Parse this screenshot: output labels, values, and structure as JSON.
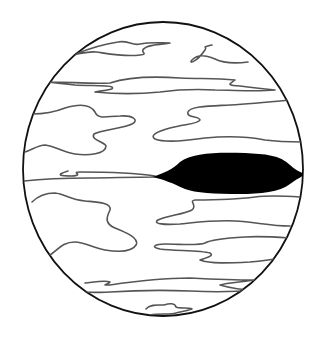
{
  "image": {
    "subject": "planet-illustration",
    "description": "Line drawing of a banded gas giant with a dark oval spot",
    "colors": {
      "background": "#ffffff",
      "outline": "#111111",
      "cloud_bands": "#555555",
      "spot": "#000000"
    },
    "planet": {
      "cx": 163,
      "cy": 169,
      "rx": 140,
      "ry": 147
    }
  }
}
